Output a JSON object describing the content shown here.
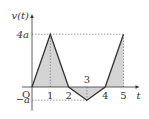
{
  "chart_data": {
    "type": "line",
    "title": "",
    "xlabel": "t",
    "ylabel": "v(t)",
    "origin_label": "O",
    "x": [
      0,
      1,
      2,
      3,
      4,
      5
    ],
    "series": [
      {
        "name": "v(t)",
        "values": [
          0,
          4,
          0,
          -1,
          0,
          4
        ]
      }
    ],
    "y_unit": "a",
    "x_tick_labels": [
      "1",
      "2",
      "3",
      "4",
      "5"
    ],
    "y_tick_labels": [
      "4a",
      "-a"
    ],
    "shaded_area": true,
    "xlim": [
      0,
      5.6
    ],
    "ylim": [
      -1.5,
      5.3
    ],
    "colors": {
      "line": "#333333",
      "fill": "#d4d4d4",
      "guide": "#777777"
    }
  }
}
